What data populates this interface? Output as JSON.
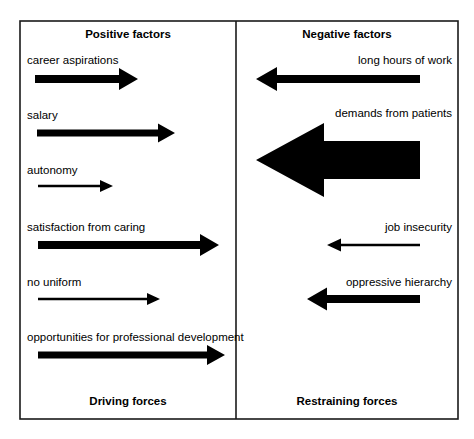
{
  "diagram": {
    "type": "force-field-analysis",
    "frame": {
      "x": 20,
      "y": 21,
      "width": 438,
      "height": 398
    },
    "divider_x": 236,
    "columns": [
      {
        "id": "positive",
        "heading": "Positive factors",
        "footing": "Driving forces",
        "direction": "right",
        "heading_x": 128,
        "footing_x": 128
      },
      {
        "id": "negative",
        "heading": "Negative factors",
        "footing": "Restraining forces",
        "direction": "left",
        "heading_x": 347,
        "footing_x": 347
      }
    ],
    "heading_y": 38,
    "footing_y": 405,
    "forces": [
      {
        "label": "career aspirations",
        "side": "positive",
        "direction": "right",
        "label_x": 27,
        "label_y": 64,
        "start_x": 35,
        "end_x": 138,
        "center_y": 79,
        "shaft_thickness": 8,
        "head_length": 19,
        "head_width": 22,
        "magnitude": "medium"
      },
      {
        "label": "salary",
        "side": "positive",
        "direction": "right",
        "label_x": 27,
        "label_y": 119,
        "start_x": 37,
        "end_x": 175,
        "center_y": 133,
        "shaft_thickness": 7,
        "head_length": 17,
        "head_width": 19,
        "magnitude": "medium"
      },
      {
        "label": "autonomy",
        "side": "positive",
        "direction": "right",
        "label_x": 27,
        "label_y": 174,
        "start_x": 38,
        "end_x": 113,
        "center_y": 186,
        "shaft_thickness": 2.6,
        "head_length": 13,
        "head_width": 12,
        "magnitude": "small"
      },
      {
        "label": "satisfaction from caring",
        "side": "positive",
        "direction": "right",
        "label_x": 27,
        "label_y": 231,
        "start_x": 38,
        "end_x": 219,
        "center_y": 245,
        "shaft_thickness": 8,
        "head_length": 19,
        "head_width": 22,
        "magnitude": "large"
      },
      {
        "label": "no uniform",
        "side": "positive",
        "direction": "right",
        "label_x": 27,
        "label_y": 286,
        "start_x": 38,
        "end_x": 160,
        "center_y": 299,
        "shaft_thickness": 2.6,
        "head_length": 13,
        "head_width": 12,
        "magnitude": "small"
      },
      {
        "label": "opportunities for professional development",
        "side": "positive",
        "direction": "right",
        "label_x": 27,
        "label_y": 341,
        "start_x": 38,
        "end_x": 225,
        "center_y": 355,
        "shaft_thickness": 7,
        "head_length": 18,
        "head_width": 20,
        "magnitude": "large"
      },
      {
        "label": "long hours of work",
        "side": "negative",
        "direction": "left",
        "label_x": 452,
        "label_y": 64,
        "start_x": 420,
        "end_x": 256,
        "center_y": 79,
        "shaft_thickness": 8,
        "head_length": 21,
        "head_width": 24,
        "magnitude": "medium"
      },
      {
        "label": "demands from patients",
        "side": "negative",
        "direction": "left",
        "label_x": 452,
        "label_y": 117,
        "start_x": 420,
        "end_x": 256,
        "center_y": 160,
        "shaft_thickness": 38,
        "head_length": 68,
        "head_width": 74,
        "magnitude": "very-large"
      },
      {
        "label": "job insecurity",
        "side": "negative",
        "direction": "left",
        "label_x": 452,
        "label_y": 231,
        "start_x": 420,
        "end_x": 327,
        "center_y": 245,
        "shaft_thickness": 2.6,
        "head_length": 14,
        "head_width": 13,
        "magnitude": "small"
      },
      {
        "label": "oppressive hierarchy",
        "side": "negative",
        "direction": "left",
        "label_x": 452,
        "label_y": 286,
        "start_x": 420,
        "end_x": 307,
        "center_y": 299,
        "shaft_thickness": 8,
        "head_length": 20,
        "head_width": 23,
        "magnitude": "medium"
      }
    ],
    "colors": {
      "arrow": "#000000",
      "frame": "#1a1a1a",
      "text": "#000000",
      "background": "#ffffff"
    }
  }
}
